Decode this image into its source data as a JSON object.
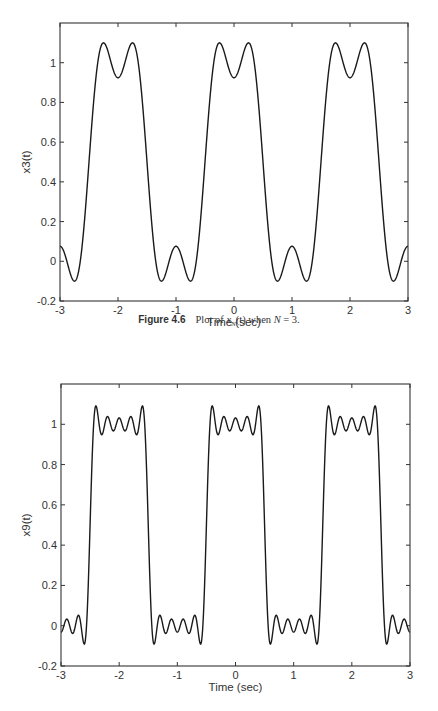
{
  "chart_data": [
    {
      "type": "line",
      "title": "",
      "xlabel": "Time (sec)",
      "ylabel": "x3(t)",
      "xlim": [
        -3,
        3
      ],
      "ylim": [
        -0.2,
        1.2
      ],
      "xticks": [
        -3,
        -2,
        -1,
        0,
        1,
        2,
        3
      ],
      "yticks": [
        -0.2,
        0,
        0.2,
        0.4,
        0.6,
        0.8,
        1
      ],
      "ytick_labels": [
        "-0.2",
        "0",
        "0.2",
        "0.4",
        "0.6",
        "0.8",
        "1"
      ],
      "grid": false,
      "legend": null,
      "series": [
        {
          "name": "x3(t)",
          "formula": "0.5 + sum_{k=1..3} (2/(k*pi)) * sin(k*pi/2) * cos(k*pi*t)",
          "harmonics": 3,
          "key_points": [
            {
              "t": -3,
              "y": 0.076
            },
            {
              "t": -2.75,
              "y": -0.1
            },
            {
              "t": -2.5,
              "y": 0.5
            },
            {
              "t": -2.25,
              "y": 1.1
            },
            {
              "t": -2,
              "y": 0.924
            },
            {
              "t": -1.75,
              "y": 1.1
            },
            {
              "t": -1.5,
              "y": 0.5
            },
            {
              "t": -1.25,
              "y": -0.1
            },
            {
              "t": -1,
              "y": 0.076
            },
            {
              "t": -0.75,
              "y": -0.1
            },
            {
              "t": -0.5,
              "y": 0.5
            },
            {
              "t": -0.25,
              "y": 1.1
            },
            {
              "t": 0,
              "y": 0.924
            },
            {
              "t": 0.25,
              "y": 1.1
            },
            {
              "t": 0.5,
              "y": 0.5
            },
            {
              "t": 0.75,
              "y": -0.1
            },
            {
              "t": 1,
              "y": 0.076
            },
            {
              "t": 1.25,
              "y": -0.1
            },
            {
              "t": 1.5,
              "y": 0.5
            },
            {
              "t": 1.75,
              "y": 1.1
            },
            {
              "t": 2,
              "y": 0.924
            },
            {
              "t": 2.25,
              "y": 1.1
            },
            {
              "t": 2.5,
              "y": 0.5
            },
            {
              "t": 2.75,
              "y": -0.1
            },
            {
              "t": 3,
              "y": 0.076
            }
          ]
        }
      ],
      "caption": {
        "label": "Figure 4.6",
        "text": "Plot of x_N(t) when N = 3."
      }
    },
    {
      "type": "line",
      "title": "",
      "xlabel": "Time (sec)",
      "ylabel": "x9(t)",
      "xlim": [
        -3,
        3
      ],
      "ylim": [
        -0.2,
        1.2
      ],
      "xticks": [
        -3,
        -2,
        -1,
        0,
        1,
        2,
        3
      ],
      "yticks": [
        -0.2,
        0,
        0.2,
        0.4,
        0.6,
        0.8,
        1
      ],
      "ytick_labels": [
        "-0.2",
        "0",
        "0.2",
        "0.4",
        "0.6",
        "0.8",
        "1"
      ],
      "grid": false,
      "legend": null,
      "series": [
        {
          "name": "x9(t)",
          "formula": "0.5 + sum_{k=1..9} (2/(k*pi)) * sin(k*pi/2) * cos(k*pi*t)",
          "harmonics": 9,
          "key_points": [
            {
              "t": -2.5,
              "y": 0.5
            },
            {
              "t": -2.4,
              "y": 1.09
            },
            {
              "t": -2,
              "y": 0.97
            },
            {
              "t": -1.6,
              "y": 1.09
            },
            {
              "t": -1.5,
              "y": 0.5
            },
            {
              "t": -1.4,
              "y": -0.09
            },
            {
              "t": -1,
              "y": 0.03
            },
            {
              "t": -0.6,
              "y": -0.09
            },
            {
              "t": -0.5,
              "y": 0.5
            },
            {
              "t": -0.4,
              "y": 1.09
            },
            {
              "t": 0,
              "y": 0.97
            },
            {
              "t": 0.4,
              "y": 1.09
            },
            {
              "t": 0.5,
              "y": 0.5
            },
            {
              "t": 0.6,
              "y": -0.09
            },
            {
              "t": 1,
              "y": 0.03
            },
            {
              "t": 1.4,
              "y": -0.09
            },
            {
              "t": 1.5,
              "y": 0.5
            },
            {
              "t": 1.6,
              "y": 1.09
            },
            {
              "t": 2,
              "y": 0.97
            },
            {
              "t": 2.4,
              "y": 1.09
            },
            {
              "t": 2.5,
              "y": 0.5
            }
          ]
        }
      ]
    }
  ],
  "figures": [
    {
      "ylabel": "x3(t)",
      "xlabel": "Time (sec)",
      "harmonics": 3,
      "box": {
        "left": 60,
        "top": 23,
        "right": 408,
        "bottom": 301
      },
      "caption": {
        "label": "Figure 4.6",
        "pre": "Plot of ",
        "var": "x",
        "sub": "N",
        "post": "(t) when ",
        "nvar": "N",
        "eq": " = 3."
      }
    },
    {
      "ylabel": "x9(t)",
      "xlabel": "Time (sec)",
      "harmonics": 9,
      "box": {
        "left": 61,
        "top": 384,
        "right": 410,
        "bottom": 666
      }
    }
  ],
  "style": {
    "line_color": "#1a1a1a",
    "axis_color": "#333333",
    "background": "#ffffff"
  }
}
